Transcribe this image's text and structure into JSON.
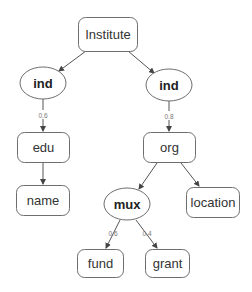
{
  "diagram": {
    "type": "tree",
    "nodes": {
      "institute": {
        "label": "Institute",
        "shape": "rounded-rect"
      },
      "ind_left": {
        "label": "ind",
        "shape": "ellipse"
      },
      "ind_right": {
        "label": "ind",
        "shape": "ellipse"
      },
      "edu": {
        "label": "edu",
        "shape": "rounded-rect"
      },
      "org": {
        "label": "org",
        "shape": "rounded-rect"
      },
      "name": {
        "label": "name",
        "shape": "rounded-rect"
      },
      "mux": {
        "label": "mux",
        "shape": "ellipse"
      },
      "location": {
        "label": "location",
        "shape": "rounded-rect"
      },
      "fund": {
        "label": "fund",
        "shape": "rounded-rect"
      },
      "grant": {
        "label": "grant",
        "shape": "rounded-rect"
      }
    },
    "edges": {
      "institute_ind_left": {
        "from": "Institute",
        "to": "ind",
        "label": ""
      },
      "institute_ind_right": {
        "from": "Institute",
        "to": "ind",
        "label": ""
      },
      "ind_left_edu": {
        "from": "ind",
        "to": "edu",
        "label": "0.6"
      },
      "ind_right_org": {
        "from": "ind",
        "to": "org",
        "label": "0.8"
      },
      "edu_name": {
        "from": "edu",
        "to": "name",
        "label": ""
      },
      "org_mux": {
        "from": "org",
        "to": "mux",
        "label": ""
      },
      "org_location": {
        "from": "org",
        "to": "location",
        "label": ""
      },
      "mux_fund": {
        "from": "mux",
        "to": "fund",
        "label": "0.6"
      },
      "mux_grant": {
        "from": "mux",
        "to": "grant",
        "label": "0.4"
      }
    }
  }
}
